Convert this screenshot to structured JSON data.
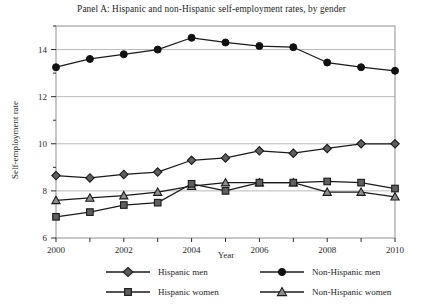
{
  "chart_data": {
    "type": "line",
    "title": "Panel A: Hispanic and non-Hispanic self-employment rates, by gender",
    "xlabel": "Year",
    "ylabel": "Self-employment rate",
    "x": [
      2000,
      2001,
      2002,
      2003,
      2004,
      2005,
      2006,
      2007,
      2008,
      2009,
      2010
    ],
    "xtick_labels": [
      "2000",
      "2002",
      "2004",
      "2006",
      "2008",
      "2010"
    ],
    "xticks": [
      2000,
      2002,
      2004,
      2006,
      2008,
      2010
    ],
    "ytick_labels": [
      "6",
      "8",
      "10",
      "12",
      "14"
    ],
    "yticks": [
      6,
      8,
      10,
      12,
      14
    ],
    "yminorticks": [
      7,
      9,
      11,
      13,
      15
    ],
    "xlim": [
      2000,
      2010
    ],
    "ylim": [
      6,
      15
    ],
    "grid": "horizontal-major",
    "legend_position": "below",
    "series": [
      {
        "name": "Hispanic men",
        "marker": "diamond",
        "values": [
          8.65,
          8.55,
          8.7,
          8.8,
          9.3,
          9.4,
          9.7,
          9.6,
          9.8,
          10.0,
          10.0
        ]
      },
      {
        "name": "Non-Hispanic men",
        "marker": "circle",
        "values": [
          13.25,
          13.6,
          13.8,
          14.0,
          14.5,
          14.3,
          14.15,
          14.1,
          13.45,
          13.25,
          13.1
        ]
      },
      {
        "name": "Hispanic women",
        "marker": "square",
        "values": [
          6.9,
          7.1,
          7.4,
          7.5,
          8.3,
          8.0,
          8.35,
          8.35,
          8.4,
          8.35,
          8.1
        ]
      },
      {
        "name": "Non-Hispanic women",
        "marker": "triangle",
        "values": [
          7.6,
          7.7,
          7.8,
          7.95,
          8.2,
          8.35,
          8.35,
          8.35,
          7.95,
          7.95,
          7.75
        ]
      }
    ]
  },
  "legend": {
    "entries": [
      {
        "label": "Hispanic men",
        "marker": "diamond"
      },
      {
        "label": "Non-Hispanic men",
        "marker": "circle"
      },
      {
        "label": "Hispanic women",
        "marker": "square"
      },
      {
        "label": "Non-Hispanic women",
        "marker": "triangle"
      }
    ]
  },
  "colors": {
    "line": "#1a1a1a",
    "grid": "#b9b9b9",
    "frame": "#9a9a9a",
    "text": "#1d1d1d",
    "background": "#ffffff"
  }
}
